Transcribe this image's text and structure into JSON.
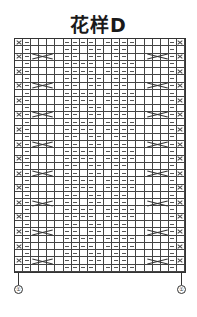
{
  "title": "花样D",
  "grid": {
    "columns": 21,
    "rows": 32,
    "row_pattern_a": [
      "X",
      "-",
      "",
      "",
      "",
      "",
      "-",
      "-",
      "-",
      "-",
      "",
      "-",
      "-",
      "-",
      "-",
      "",
      "",
      "",
      "",
      "-",
      "X"
    ],
    "row_pattern_b": [
      "",
      "-",
      "",
      "",
      "",
      "",
      "-",
      "-",
      "",
      "-",
      "-",
      "",
      "-",
      "-",
      "",
      "",
      "",
      "",
      "",
      "-",
      ""
    ],
    "row_pattern_c": [
      "X",
      "-",
      "",
      "",
      "",
      "",
      "-",
      "-",
      "",
      "-",
      "-",
      "",
      "-",
      "-",
      "",
      "",
      "",
      "",
      "",
      "-",
      "X"
    ],
    "row_pattern_d": [
      "",
      "-",
      "",
      "",
      "",
      "",
      "-",
      "-",
      "-",
      "-",
      "",
      "-",
      "-",
      "-",
      "-",
      "",
      "",
      "",
      "",
      "-",
      ""
    ],
    "cable_cols_left": [
      2,
      4
    ],
    "cable_cols_right": [
      16,
      18
    ],
    "cable_every_rows": 4,
    "legend": {
      "X": "cross-stitch",
      "-": "purl",
      "": "knit"
    }
  },
  "markers": {
    "left_label": "①",
    "right_label": "①"
  }
}
